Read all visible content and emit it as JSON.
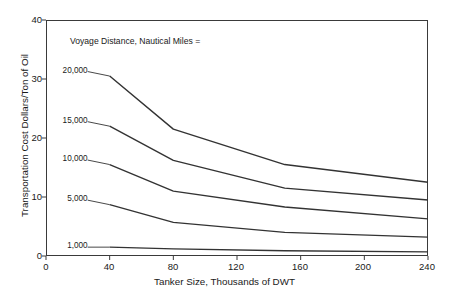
{
  "chart_data": {
    "type": "line",
    "title": "",
    "xlabel": "Tanker Size, Thousands of DWT",
    "ylabel": "Transportation Cost Dollars/Ton of Oil",
    "xlim": [
      0,
      240
    ],
    "ylim": [
      0,
      40
    ],
    "xticks": [
      "0",
      "40",
      "80",
      "120",
      "160",
      "200",
      "240"
    ],
    "yticks": [
      "0",
      "10",
      "20",
      "30",
      "40"
    ],
    "grid": false,
    "legend_position": "inline-left-labels",
    "annotation": "Voyage Distance, Nautical Miles =",
    "x": [
      40,
      80,
      150,
      240
    ],
    "series": [
      {
        "name": "20,000",
        "label": "20,000",
        "values": [
          30.5,
          21.5,
          15.5,
          12.5
        ]
      },
      {
        "name": "15,000",
        "label": "15,000",
        "values": [
          22.0,
          16.2,
          11.5,
          9.5
        ]
      },
      {
        "name": "10,000",
        "label": "10,000",
        "values": [
          15.5,
          11.0,
          8.3,
          6.3
        ]
      },
      {
        "name": "5,000",
        "label": "5,000",
        "values": [
          8.7,
          5.7,
          4.0,
          3.2
        ]
      },
      {
        "name": "1,000",
        "label": "1,000",
        "values": [
          1.5,
          1.2,
          0.9,
          0.7
        ]
      }
    ],
    "line_color": "#333333"
  },
  "axis": {
    "y_labels": [
      "40",
      "30",
      "20",
      "10",
      "0"
    ],
    "x_labels": [
      "0",
      "40",
      "80",
      "120",
      "160",
      "200",
      "240"
    ]
  }
}
